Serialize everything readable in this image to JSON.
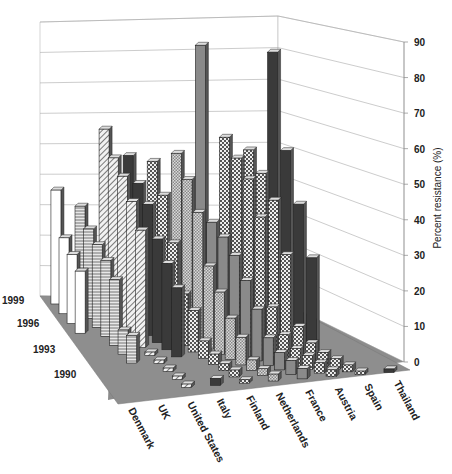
{
  "chart_data": {
    "type": "bar",
    "subtype": "3d-bar",
    "title": "",
    "ylabel": "Percent resistance (%)",
    "xlabel": "",
    "zlabel": "",
    "ylim": [
      0,
      90
    ],
    "y_ticks": [
      "0",
      "10",
      "20",
      "30",
      "40",
      "50",
      "60",
      "70",
      "80",
      "90"
    ],
    "categories": [
      "Denmark",
      "UK",
      "United States",
      "Italy",
      "Finland",
      "Netherlands",
      "France",
      "Austria",
      "Spain",
      "Thailand"
    ],
    "year_labels": [
      "1999",
      "1996",
      "1993",
      "1990"
    ],
    "series_years": [
      1990,
      1991,
      1992,
      1993,
      1994,
      1995,
      1996,
      1997,
      1998,
      1999
    ],
    "grid": true,
    "legend": "none",
    "series": [
      {
        "name": "Denmark",
        "pattern": "white",
        "values": [
          null,
          null,
          null,
          null,
          null,
          null,
          18,
          20,
          22,
          33
        ]
      },
      {
        "name": "UK",
        "pattern": "hlines",
        "values": [
          null,
          null,
          null,
          8,
          7,
          19,
          22,
          24,
          26,
          30
        ]
      },
      {
        "name": "United States",
        "pattern": "diagonal",
        "values": [
          1,
          1,
          1,
          1,
          1,
          34,
          40,
          45,
          48,
          54
        ]
      },
      {
        "name": "Italy",
        "pattern": "dark",
        "values": [
          2,
          null,
          null,
          null,
          20,
          25,
          30,
          38,
          42,
          48
        ]
      },
      {
        "name": "Finland",
        "pattern": "checker",
        "values": [
          1,
          2,
          2,
          3,
          5,
          12,
          15,
          28,
          40,
          48
        ]
      },
      {
        "name": "Netherlands",
        "pattern": "fine-checker",
        "values": [
          2,
          2,
          3,
          8,
          12,
          18,
          24,
          38,
          46,
          52
        ]
      },
      {
        "name": "France",
        "pattern": "gray",
        "values": [
          3,
          4,
          5,
          8,
          15,
          22,
          28,
          32,
          35,
          85
        ]
      },
      {
        "name": "Austria",
        "pattern": "checker",
        "values": [
          2,
          3,
          4,
          5,
          8,
          15,
          40,
          50,
          55,
          60
        ]
      },
      {
        "name": "Spain",
        "pattern": "checker",
        "values": [
          1,
          2,
          3,
          4,
          6,
          10,
          30,
          45,
          52,
          58
        ]
      },
      {
        "name": "Thailand",
        "pattern": "dark",
        "values": [
          1,
          null,
          null,
          null,
          null,
          null,
          30,
          45,
          60,
          88
        ]
      }
    ]
  }
}
